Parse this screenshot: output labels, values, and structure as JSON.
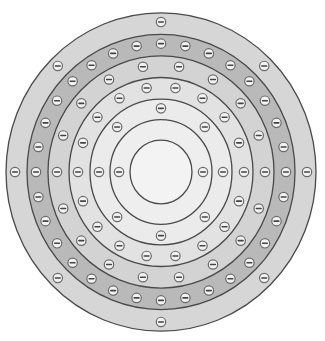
{
  "diagram": {
    "title": "",
    "center": {
      "x": 161,
      "y": 172
    },
    "aspect_y": 1.027,
    "electron_symbol": "−",
    "electron_radius": 4.7,
    "nucleus": {
      "radius": 31,
      "fill": "#f3f3f3"
    },
    "bands": [
      {
        "name": "shell-1",
        "outer_radius": 51,
        "fill": "#eeeeee",
        "electron_orbit": 42,
        "electron_count": 2,
        "start_angle": 0
      },
      {
        "name": "shell-2",
        "outer_radius": 71,
        "fill": "#ebebeb",
        "electron_orbit": 62,
        "electron_count": 8,
        "start_angle": 0
      },
      {
        "name": "shell-3",
        "outer_radius": 92,
        "fill": "#e2e2e2",
        "electron_orbit": 83,
        "electron_count": 18,
        "start_angle": 0
      },
      {
        "name": "shell-4",
        "outer_radius": 113,
        "fill": "#d3d3d3",
        "electron_orbit": 104,
        "electron_count": 18,
        "start_angle": 0
      },
      {
        "name": "shell-5",
        "outer_radius": 134,
        "fill": "#b9b9b9",
        "electron_orbit": 125,
        "electron_count": 32,
        "start_angle": 0
      },
      {
        "name": "shell-6",
        "outer_radius": 155,
        "fill": "#d6d6d6",
        "electron_orbit": 146,
        "electron_count": 8,
        "start_angle": 0
      }
    ],
    "electron_counts_summary": [
      2,
      8,
      18,
      18,
      32,
      8
    ],
    "total_electrons": 86
  }
}
